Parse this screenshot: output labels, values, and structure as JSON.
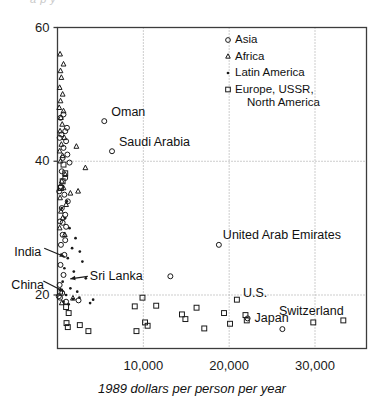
{
  "figure": {
    "background": "#ffffff",
    "frame_color": "#3c3c3c",
    "grid_color": "#9a9a9a",
    "marker_color": "#1a1a1a",
    "partial_top_text": "a  p y"
  },
  "chart_data": {
    "type": "scatter",
    "title": "",
    "xlabel": "1989 dollars per person per year",
    "ylabel": "",
    "xlim": [
      0,
      36000
    ],
    "ylim": [
      12,
      60
    ],
    "xticks": [
      10000,
      20000,
      30000
    ],
    "xtick_labels": [
      "10,000",
      "20,000",
      "30,000"
    ],
    "yticks": [
      20,
      40,
      60
    ],
    "ytick_labels": [
      "20",
      "40",
      "60"
    ],
    "grid": "dotted gridlines at y=20, y=40 and x=10000, 20000, 30000",
    "legend_position": "upper right inside axes",
    "legend": [
      {
        "marker": "circle",
        "label": "Asia"
      },
      {
        "marker": "triangle",
        "label": "Africa"
      },
      {
        "marker": "dot",
        "label": "Latin America"
      },
      {
        "marker": "square",
        "label": "Europe, USSR,\nNorth America"
      }
    ],
    "series": [
      {
        "name": "Asia",
        "marker": "circle",
        "points": [
          [
            5450,
            46.0
          ],
          [
            6350,
            41.5
          ],
          [
            13150,
            22.8
          ],
          [
            18800,
            27.5
          ],
          [
            22150,
            16.5
          ],
          [
            26200,
            14.9
          ],
          [
            900,
            44.5
          ],
          [
            1000,
            43.0
          ],
          [
            700,
            42.0
          ],
          [
            1150,
            41.0
          ],
          [
            600,
            40.5
          ],
          [
            1400,
            39.8
          ],
          [
            500,
            38.5
          ],
          [
            900,
            37.5
          ],
          [
            400,
            36.2
          ],
          [
            800,
            35.0
          ],
          [
            1200,
            34.0
          ],
          [
            500,
            33.0
          ],
          [
            900,
            32.0
          ],
          [
            300,
            31.0
          ],
          [
            1000,
            30.2
          ],
          [
            600,
            29.0
          ],
          [
            400,
            27.5
          ],
          [
            800,
            26.0
          ],
          [
            350,
            24.5
          ],
          [
            700,
            23.0
          ],
          [
            250,
            21.5
          ],
          [
            550,
            20.3
          ],
          [
            300,
            19.6
          ],
          [
            1000,
            19.0
          ],
          [
            2450,
            19.2
          ],
          [
            150,
            19.8
          ],
          [
            200,
            35.5
          ],
          [
            450,
            44.0
          ],
          [
            700,
            47.0
          ],
          [
            350,
            46.5
          ],
          [
            1100,
            45.0
          ],
          [
            250,
            43.5
          ],
          [
            600,
            30.8
          ],
          [
            900,
            28.2
          ]
        ]
      },
      {
        "name": "Africa",
        "marker": "triangle",
        "points": [
          [
            300,
            56.0
          ],
          [
            450,
            52.5
          ],
          [
            250,
            51.0
          ],
          [
            600,
            50.0
          ],
          [
            350,
            49.0
          ],
          [
            200,
            48.0
          ],
          [
            700,
            47.5
          ],
          [
            400,
            46.5
          ],
          [
            550,
            45.5
          ],
          [
            300,
            44.5
          ],
          [
            800,
            43.5
          ],
          [
            450,
            42.5
          ],
          [
            250,
            41.5
          ],
          [
            600,
            40.8
          ],
          [
            350,
            40.0
          ],
          [
            2200,
            42.2
          ],
          [
            3250,
            39.0
          ],
          [
            2400,
            35.5
          ],
          [
            900,
            38.0
          ],
          [
            500,
            37.0
          ],
          [
            700,
            36.0
          ],
          [
            300,
            34.5
          ],
          [
            1000,
            33.5
          ],
          [
            400,
            32.5
          ],
          [
            1500,
            35.2
          ],
          [
            600,
            31.5
          ],
          [
            250,
            30.0
          ],
          [
            850,
            29.0
          ],
          [
            1800,
            19.5
          ],
          [
            500,
            18.8
          ],
          [
            350,
            53.5
          ],
          [
            700,
            54.5
          ]
        ]
      },
      {
        "name": "Latin America",
        "marker": "dot",
        "points": [
          [
            900,
            31.5
          ],
          [
            1400,
            30.0
          ],
          [
            2100,
            28.5
          ],
          [
            1700,
            27.0
          ],
          [
            2600,
            26.5
          ],
          [
            1200,
            25.5
          ],
          [
            2900,
            25.0
          ],
          [
            800,
            24.0
          ],
          [
            1900,
            23.5
          ],
          [
            3300,
            22.5
          ],
          [
            600,
            22.0
          ],
          [
            1500,
            21.0
          ],
          [
            2300,
            20.5
          ],
          [
            1000,
            20.0
          ],
          [
            1800,
            19.4
          ],
          [
            2550,
            19.6
          ],
          [
            4150,
            19.3
          ],
          [
            700,
            19.0
          ],
          [
            1300,
            18.6
          ],
          [
            3800,
            18.8
          ],
          [
            500,
            33.0
          ],
          [
            1100,
            34.0
          ]
        ]
      },
      {
        "name": "Europe, USSR, North America",
        "marker": "square",
        "points": [
          [
            700,
            39.5
          ],
          [
            900,
            38.2
          ],
          [
            600,
            37.0
          ],
          [
            400,
            36.0
          ],
          [
            300,
            20.5
          ],
          [
            1000,
            18.2
          ],
          [
            1300,
            17.3
          ],
          [
            1050,
            15.8
          ],
          [
            1200,
            15.2
          ],
          [
            2600,
            15.5
          ],
          [
            3600,
            14.6
          ],
          [
            9900,
            19.6
          ],
          [
            9000,
            18.3
          ],
          [
            11500,
            18.4
          ],
          [
            10200,
            15.9
          ],
          [
            10500,
            15.4
          ],
          [
            9200,
            14.6
          ],
          [
            14500,
            17.1
          ],
          [
            14900,
            16.4
          ],
          [
            16200,
            18.1
          ],
          [
            17100,
            15.0
          ],
          [
            19400,
            17.3
          ],
          [
            20900,
            19.3
          ],
          [
            21900,
            17.0
          ],
          [
            22050,
            16.2
          ],
          [
            20100,
            15.7
          ],
          [
            29800,
            15.9
          ],
          [
            33300,
            16.2
          ]
        ]
      }
    ],
    "annotations": [
      {
        "text": "Oman",
        "x": 5450,
        "y": 46.0,
        "arrow": false
      },
      {
        "text": "Saudi Arabia",
        "x": 6350,
        "y": 41.5,
        "arrow": false
      },
      {
        "text": "United Arab Emirates",
        "x": 18800,
        "y": 27.5,
        "arrow": false
      },
      {
        "text": "India",
        "x": 550,
        "y": 25.5,
        "arrow": true
      },
      {
        "text": "China",
        "x": 450,
        "y": 20.3,
        "arrow": true
      },
      {
        "text": "Sri Lanka",
        "x": 1200,
        "y": 22.2,
        "arrow": true
      },
      {
        "text": "U.S.",
        "x": 20900,
        "y": 19.3,
        "arrow": false
      },
      {
        "text": "Japan",
        "x": 22150,
        "y": 16.5,
        "arrow": false
      },
      {
        "text": "Switzerland",
        "x": 29800,
        "y": 15.9,
        "arrow": false
      }
    ]
  }
}
